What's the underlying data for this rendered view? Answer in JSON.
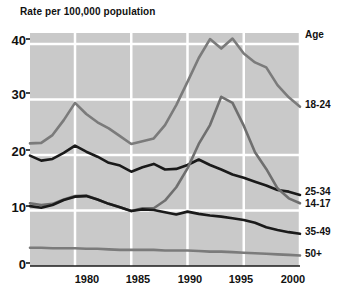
{
  "chart_data": {
    "type": "line",
    "title": "Rate per 100,000 population",
    "xlabel": "",
    "ylabel": "Rate per 100,000 population",
    "xlim": [
      1976,
      2000
    ],
    "ylim": [
      0,
      42
    ],
    "yticks": [
      0,
      10,
      20,
      30,
      40
    ],
    "xticks": [
      1980,
      1985,
      1990,
      1995,
      2000
    ],
    "grid": true,
    "legend_position": "right",
    "legend_title": "Age",
    "x": [
      1976,
      1977,
      1978,
      1979,
      1980,
      1981,
      1982,
      1983,
      1984,
      1985,
      1986,
      1987,
      1988,
      1989,
      1990,
      1991,
      1992,
      1993,
      1994,
      1995,
      1996,
      1997,
      1998,
      1999,
      2000
    ],
    "series": [
      {
        "name": "18-24",
        "color": "#7b7b7b",
        "values": [
          22.1,
          22.2,
          23.6,
          26.3,
          29.4,
          27.4,
          25.9,
          24.8,
          23.4,
          22.0,
          22.5,
          23.0,
          25.4,
          29.0,
          33.2,
          37.5,
          40.9,
          39.2,
          41.0,
          38.3,
          36.7,
          35.8,
          32.6,
          30.4,
          28.7
        ]
      },
      {
        "name": "25-34",
        "color": "#1a1a1a",
        "values": [
          19.9,
          19.0,
          19.3,
          20.4,
          21.7,
          20.6,
          19.7,
          18.6,
          18.1,
          17.0,
          17.8,
          18.4,
          17.4,
          17.5,
          18.2,
          19.2,
          18.2,
          17.4,
          16.5,
          15.9,
          15.2,
          14.5,
          13.7,
          13.4,
          12.8
        ]
      },
      {
        "name": "14-17",
        "color": "#6f6f6f",
        "values": [
          11.3,
          11.0,
          11.2,
          12.0,
          12.6,
          12.7,
          12.0,
          11.2,
          10.6,
          9.9,
          10.4,
          10.4,
          11.8,
          14.2,
          17.6,
          22.0,
          25.4,
          30.5,
          29.4,
          25.3,
          20.5,
          17.5,
          14.0,
          12.2,
          11.3
        ]
      },
      {
        "name": "35-49",
        "color": "#1a1a1a",
        "values": [
          10.8,
          10.5,
          11.0,
          11.9,
          12.5,
          12.6,
          12.0,
          11.2,
          10.6,
          9.9,
          10.2,
          10.1,
          9.7,
          9.3,
          9.8,
          9.4,
          9.1,
          8.9,
          8.6,
          8.3,
          7.8,
          7.0,
          6.5,
          6.1,
          5.8
        ]
      },
      {
        "name": "50+",
        "color": "#7b7b7b",
        "values": [
          3.3,
          3.3,
          3.2,
          3.2,
          3.2,
          3.1,
          3.1,
          3.0,
          2.9,
          2.9,
          2.9,
          2.9,
          2.8,
          2.8,
          2.8,
          2.7,
          2.6,
          2.6,
          2.5,
          2.4,
          2.3,
          2.2,
          2.1,
          2.0,
          1.9
        ]
      }
    ],
    "series_labels": [
      {
        "text": "18-24",
        "x": 305,
        "y": 99
      },
      {
        "text": "25-34",
        "x": 305,
        "y": 186
      },
      {
        "text": "14-17",
        "x": 305,
        "y": 198
      },
      {
        "text": "35-49",
        "x": 305,
        "y": 226
      },
      {
        "text": "50+",
        "x": 305,
        "y": 248
      }
    ],
    "ytick_labels": [
      {
        "text": "40",
        "y": 33
      },
      {
        "text": "30",
        "y": 87
      },
      {
        "text": "20",
        "y": 144
      },
      {
        "text": "10",
        "y": 200
      },
      {
        "text": "0",
        "y": 257
      }
    ],
    "xtick_labels": [
      {
        "text": "1980",
        "x": 87
      },
      {
        "text": "1985",
        "x": 138
      },
      {
        "text": "1990",
        "x": 190
      },
      {
        "text": "1995",
        "x": 241
      },
      {
        "text": "2000",
        "x": 293
      }
    ],
    "panel": {
      "background": "#c9c9c9",
      "gridline_color": "#ffffff",
      "left": 30,
      "top": 33,
      "right": 300,
      "bottom": 266
    }
  }
}
